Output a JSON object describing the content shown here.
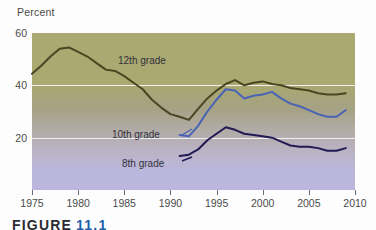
{
  "axis": {
    "y_title": "Percent",
    "y_ticks": [
      20,
      40,
      60
    ],
    "y_min": 0,
    "y_max": 60,
    "x_ticks": [
      1975,
      1980,
      1985,
      1990,
      1995,
      2000,
      2005,
      2010
    ],
    "x_min": 1975,
    "x_max": 2010
  },
  "caption": {
    "word": "FIGURE",
    "number": "11.1"
  },
  "colors": {
    "grade12": "#4a4622",
    "grade10": "#4a63b4",
    "grade8": "#221a53",
    "gridline": "#f2f2f4",
    "bg_top": "#a9a971",
    "bg_bottom": "#bab6dd",
    "caption_number": "#1f5fa8"
  },
  "labels": [
    {
      "name": "grade12",
      "text": "12th grade",
      "x": 118,
      "y": 55
    },
    {
      "name": "grade10",
      "text": "10th grade",
      "x": 112,
      "y": 129
    },
    {
      "name": "grade8",
      "text": "8th grade",
      "x": 122,
      "y": 158
    }
  ],
  "chart_data": {
    "type": "line",
    "title": "",
    "xlabel": "",
    "ylabel": "Percent",
    "xlim": [
      1975,
      2010
    ],
    "ylim": [
      0,
      60
    ],
    "grid": true,
    "legend": "inline-labels",
    "series": [
      {
        "name": "12th grade",
        "color": "#4a4622",
        "x": [
          1975,
          1976,
          1977,
          1978,
          1979,
          1980,
          1981,
          1982,
          1983,
          1984,
          1985,
          1986,
          1987,
          1988,
          1989,
          1990,
          1991,
          1992,
          1993,
          1994,
          1995,
          1996,
          1997,
          1998,
          1999,
          2000,
          2001,
          2002,
          2003,
          2004,
          2005,
          2006,
          2007,
          2008,
          2009
        ],
        "values": [
          44.4,
          47.5,
          51.0,
          54.0,
          54.5,
          52.8,
          51.0,
          48.5,
          46.0,
          45.5,
          43.5,
          41.0,
          38.5,
          34.5,
          31.5,
          29.0,
          28.0,
          26.8,
          31.0,
          35.0,
          38.0,
          40.5,
          42.0,
          40.0,
          41.0,
          41.5,
          40.5,
          40.0,
          39.0,
          38.5,
          38.0,
          37.0,
          36.5,
          36.5,
          37.0
        ]
      },
      {
        "name": "10th grade",
        "color": "#4a63b4",
        "x": [
          1991,
          1992,
          1993,
          1994,
          1995,
          1996,
          1997,
          1998,
          1999,
          2000,
          2001,
          2002,
          2003,
          2004,
          2005,
          2006,
          2007,
          2008,
          2009
        ],
        "values": [
          21.0,
          20.5,
          24.5,
          30.0,
          34.5,
          38.5,
          38.0,
          35.0,
          36.0,
          36.5,
          37.5,
          35.0,
          33.0,
          32.0,
          30.5,
          29.0,
          28.0,
          28.0,
          30.5
        ]
      },
      {
        "name": "8th grade",
        "color": "#221a53",
        "x": [
          1991,
          1992,
          1993,
          1994,
          1995,
          1996,
          1997,
          1998,
          1999,
          2000,
          2001,
          2002,
          2003,
          2004,
          2005,
          2006,
          2007,
          2008,
          2009
        ],
        "values": [
          13.0,
          13.5,
          15.5,
          19.0,
          21.5,
          24.0,
          23.0,
          21.5,
          21.0,
          20.5,
          20.0,
          18.5,
          17.0,
          16.5,
          16.5,
          16.0,
          15.0,
          15.0,
          16.0
        ]
      }
    ]
  }
}
